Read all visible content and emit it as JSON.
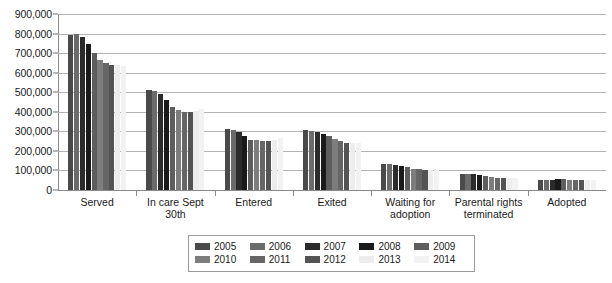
{
  "chart_data": {
    "type": "bar",
    "title": "",
    "subtitle": "",
    "xlabel": "",
    "ylabel": "",
    "ylim": [
      0,
      900000
    ],
    "ytick_interval": 100000,
    "ytick_labels": [
      "900,000",
      "800,000",
      "700,000",
      "600,000",
      "500,000",
      "400,000",
      "300,000",
      "200,000",
      "100,000",
      "0"
    ],
    "ytick_values": [
      900000,
      800000,
      700000,
      600000,
      500000,
      400000,
      300000,
      200000,
      100000,
      0
    ],
    "grid": true,
    "grid_axis": "y",
    "legend_position": "bottom",
    "categories": [
      "Served",
      "In care Sept 30th",
      "Entered",
      "Exited",
      "Waiting for adoption",
      "Parental rights terminated",
      "Adopted"
    ],
    "series": [
      {
        "name": "2005",
        "color": "#4a4a4a",
        "values": [
          795000,
          511000,
          312000,
          305000,
          134000,
          84000,
          53000
        ]
      },
      {
        "name": "2006",
        "color": "#6b6b6b",
        "values": [
          799000,
          505000,
          309000,
          303000,
          132000,
          82000,
          53000
        ]
      },
      {
        "name": "2007",
        "color": "#2b2b2b",
        "values": [
          781000,
          490000,
          297000,
          297000,
          129000,
          80000,
          53000
        ]
      },
      {
        "name": "2008",
        "color": "#1a1a1a",
        "values": [
          746000,
          462000,
          275000,
          287000,
          124000,
          76000,
          55000
        ]
      },
      {
        "name": "2009",
        "color": "#5e5e5e",
        "values": [
          699000,
          427000,
          257000,
          276000,
          117000,
          70000,
          57000
        ]
      },
      {
        "name": "2010",
        "color": "#7d7d7d",
        "values": [
          665000,
          408000,
          255000,
          262000,
          110000,
          65000,
          53000
        ]
      },
      {
        "name": "2011",
        "color": "#666666",
        "values": [
          650000,
          401000,
          253000,
          251000,
          108000,
          62000,
          51000
        ]
      },
      {
        "name": "2012",
        "color": "#545454",
        "values": [
          641000,
          399000,
          252000,
          241000,
          102000,
          59000,
          52000
        ]
      },
      {
        "name": "2013",
        "color": "#ededed",
        "values": [
          641000,
          402000,
          255000,
          239000,
          104000,
          59000,
          51000
        ]
      },
      {
        "name": "2014",
        "color": "#f2f2f2",
        "values": [
          635000,
          415000,
          265000,
          238000,
          108000,
          61000,
          51000
        ]
      }
    ]
  }
}
